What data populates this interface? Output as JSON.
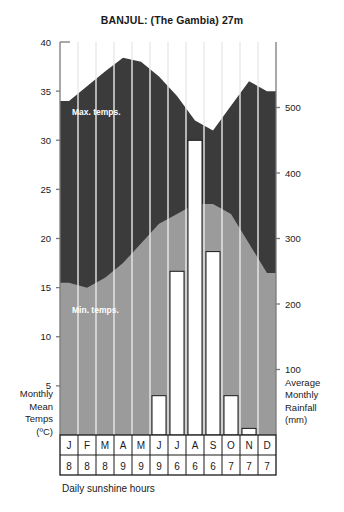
{
  "title": "BANJUL: (The Gambia) 27m",
  "labels": {
    "max_temps": "Max. temps.",
    "min_temps": "Min. temps.",
    "left_axis": [
      "Monthly",
      "Mean",
      "Temps",
      "(ºC)"
    ],
    "right_axis": [
      "Average",
      "Monthly",
      "Rainfall",
      "(mm)"
    ],
    "footer": "Daily sunshine hours"
  },
  "colors": {
    "max_band": "#3b3b3b",
    "min_band": "#9b9b9b",
    "bar_fill": "#ffffff",
    "bar_stroke": "#1a1a1a",
    "axis": "#7a7a7a",
    "gridline": "#e8e8e8",
    "text": "#1a1a1a"
  },
  "chart_data": {
    "type": "area",
    "title": "BANJUL: (The Gambia) 27m",
    "categories": [
      "J",
      "F",
      "M",
      "A",
      "M",
      "J",
      "J",
      "A",
      "S",
      "O",
      "N",
      "D"
    ],
    "months_full": [
      "January",
      "February",
      "March",
      "April",
      "May",
      "June",
      "July",
      "August",
      "September",
      "October",
      "November",
      "December"
    ],
    "xlabel": "",
    "ylabel": "Monthly Mean Temps (ºC)",
    "y2label": "Average Monthly Rainfall (mm)",
    "ylim": [
      0,
      40
    ],
    "y2lim": [
      0,
      600
    ],
    "yticks": [
      5,
      10,
      15,
      20,
      25,
      30,
      35,
      40
    ],
    "y2ticks": [
      100,
      200,
      300,
      400,
      500
    ],
    "grid": true,
    "legend_position": "inline-annotation",
    "series": [
      {
        "name": "Max. temps.",
        "unit": "ºC",
        "axis": "left",
        "type": "area",
        "values": [
          34.0,
          35.5,
          37.0,
          38.4,
          38.0,
          36.5,
          34.5,
          32.0,
          31.0,
          33.5,
          36.0,
          35.0
        ]
      },
      {
        "name": "Min. temps.",
        "unit": "ºC",
        "axis": "left",
        "type": "area",
        "values": [
          15.5,
          15.0,
          16.0,
          17.5,
          19.5,
          21.5,
          22.5,
          23.5,
          23.5,
          22.5,
          19.5,
          16.5
        ]
      },
      {
        "name": "Average Monthly Rainfall",
        "unit": "mm",
        "axis": "right",
        "type": "bar",
        "values": [
          0,
          0,
          0,
          0,
          0,
          60,
          250,
          450,
          280,
          60,
          10,
          0
        ]
      },
      {
        "name": "Daily sunshine hours",
        "unit": "hours",
        "axis": "table",
        "type": "table",
        "values": [
          8,
          8,
          8,
          9,
          9,
          9,
          6,
          6,
          6,
          7,
          7,
          7
        ]
      }
    ]
  }
}
